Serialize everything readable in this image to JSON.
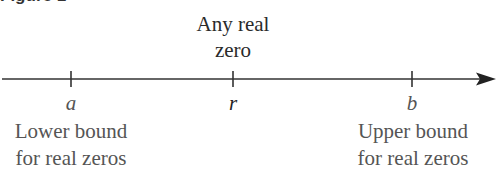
{
  "figure": {
    "label": "Figure 1"
  },
  "number_line": {
    "line_color": "#333333",
    "arrow_direction": "right",
    "ticks": [
      {
        "id": "a",
        "x": 71,
        "symbol": "a"
      },
      {
        "id": "r",
        "x": 233,
        "symbol": "r"
      },
      {
        "id": "b",
        "x": 412,
        "symbol": "b"
      }
    ]
  },
  "annotations": {
    "top": {
      "line1": "Any real",
      "line2": "zero"
    },
    "lower_bound": {
      "line1": "Lower bound",
      "line2": "for real zeros"
    },
    "upper_bound": {
      "line1": "Upper bound",
      "line2": "for real zeros"
    }
  },
  "colors": {
    "primary_text": "#222222",
    "secondary_text": "#555555",
    "background": "#ffffff"
  }
}
